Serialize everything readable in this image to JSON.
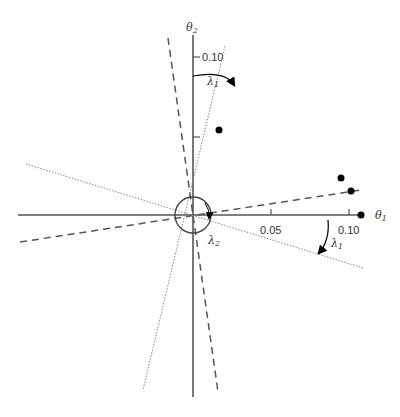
{
  "diagram": {
    "axes": {
      "x_label": "θ",
      "x_label_sub": "1",
      "y_label": "θ",
      "y_label_sub": "2",
      "x_ticks": [
        {
          "value": 0.05,
          "label": "0.05"
        },
        {
          "value": 0.1,
          "label": "0.10"
        }
      ],
      "y_ticks": [
        {
          "value": 0.05,
          "label": ""
        },
        {
          "value": 0.1,
          "label": "0.10"
        }
      ]
    },
    "angle_labels": {
      "lambda1_top": {
        "symbol": "λ",
        "sub": "1"
      },
      "lambda1_right": {
        "symbol": "λ",
        "sub": "1"
      },
      "lambda2": {
        "symbol": "λ",
        "sub": "2"
      }
    },
    "points": [
      {
        "theta1": 0.017,
        "theta2": 0.055
      },
      {
        "theta1": 0.097,
        "theta2": 0.025
      },
      {
        "theta1": 0.101,
        "theta2": 0.017
      },
      {
        "theta1": 0.108,
        "theta2": 0.0
      }
    ],
    "lines": {
      "dashed": "principal axes (dashed)",
      "dotted": "rotated axes (dotted)"
    },
    "colors": {
      "axis": "#555555",
      "points": "#000000",
      "lines": "#666666"
    }
  }
}
